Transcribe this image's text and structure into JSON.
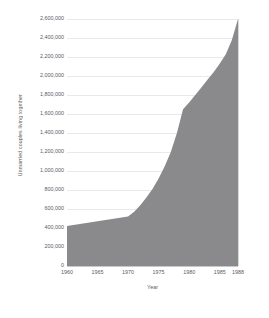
{
  "chart_data": {
    "type": "area",
    "title": "",
    "xlabel": "Year",
    "ylabel": "Unmarried couples living together",
    "xlim": [
      1960,
      1988
    ],
    "ylim": [
      0,
      2600000
    ],
    "grid": true,
    "legend": false,
    "fill_color": "#8a8a8c",
    "gridline_color": "#e9e9ea",
    "axis_color": "#c9c9ca",
    "text_color": "#5c5c5e",
    "x_tick_labels": [
      "1960",
      "1965",
      "1970",
      "1975",
      "1980",
      "1985",
      "1988"
    ],
    "x_tick_values": [
      1960,
      1965,
      1970,
      1975,
      1980,
      1985,
      1988
    ],
    "y_tick_labels": [
      "0",
      "200,000",
      "400,000",
      "600,000",
      "800,000",
      "1,000,000",
      "1,200,000",
      "1,400,000",
      "1,600,000",
      "1,800,000",
      "2,000,000",
      "2,200,000",
      "2,400,000",
      "2,600,000"
    ],
    "y_tick_values": [
      0,
      200000,
      400000,
      600000,
      800000,
      1000000,
      1200000,
      1400000,
      1600000,
      1800000,
      2000000,
      2200000,
      2400000,
      2600000
    ],
    "x": [
      1960,
      1965,
      1970,
      1971,
      1972,
      1973,
      1974,
      1975,
      1976,
      1977,
      1978,
      1979,
      1980,
      1981,
      1982,
      1983,
      1984,
      1985,
      1986,
      1987,
      1988
    ],
    "values": [
      420000,
      470000,
      520000,
      570000,
      640000,
      720000,
      810000,
      920000,
      1050000,
      1200000,
      1400000,
      1650000,
      1720000,
      1800000,
      1880000,
      1960000,
      2040000,
      2130000,
      2230000,
      2380000,
      2600000
    ],
    "series": [
      {
        "name": "Unmarried couples living together",
        "values": [
          420000,
          470000,
          520000,
          570000,
          640000,
          720000,
          810000,
          920000,
          1050000,
          1200000,
          1400000,
          1650000,
          1720000,
          1800000,
          1880000,
          1960000,
          2040000,
          2130000,
          2230000,
          2380000,
          2600000
        ]
      }
    ]
  }
}
